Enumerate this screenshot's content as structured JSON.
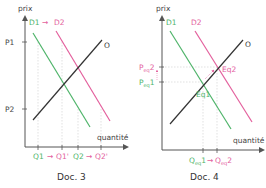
{
  "colors": {
    "demand1": "#4fb46a",
    "demand2": "#e3609d",
    "supply": "#333333",
    "axis": "#555555",
    "guide": "#bbbbbb"
  },
  "doc3": {
    "caption": "Doc. 3",
    "y_axis_label": "prix",
    "x_axis_label": "quantité",
    "legend": {
      "d1": "D1",
      "arrow": "→",
      "d2": "D2"
    },
    "supply_label": "O",
    "price_ticks": [
      "P1",
      "P2"
    ],
    "quantity_ticks": [
      {
        "label": "Q1",
        "color": "demand1"
      },
      {
        "label": "Q1'",
        "color": "demand2"
      },
      {
        "label": "Q2",
        "color": "demand1"
      },
      {
        "label": "Q2'",
        "color": "demand2"
      }
    ],
    "arrow": "→"
  },
  "doc4": {
    "caption": "Doc. 4",
    "y_axis_label": "prix",
    "x_axis_label": "quantité",
    "d1_label": "D1",
    "d2_label": "D2",
    "supply_label": "O",
    "eq1_label": "Eq1",
    "eq2_label": "Eq2",
    "price_ticks": [
      {
        "main": "P",
        "sub": "eq",
        "suffix": "2",
        "color": "demand2"
      },
      {
        "main": "P",
        "sub": "eq",
        "suffix": "1",
        "color": "demand1"
      }
    ],
    "quantity_ticks": [
      {
        "main": "Q",
        "sub": "eq",
        "suffix": "1",
        "color": "demand1"
      },
      {
        "main": "Q",
        "sub": "eq",
        "suffix": "2",
        "color": "demand2"
      }
    ],
    "arrow": "→"
  }
}
